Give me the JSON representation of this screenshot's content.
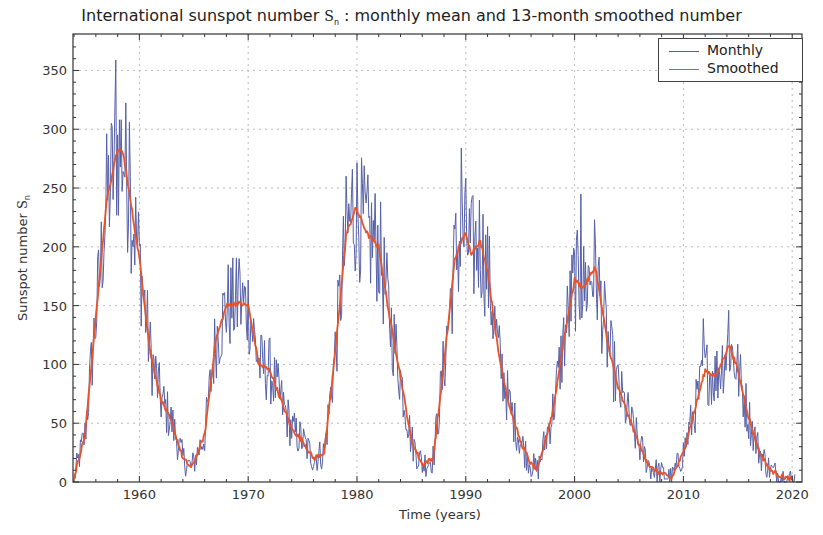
{
  "chart_data": {
    "type": "line",
    "title": "International sunspot number Sn : monthly mean and 13-month smoothed number",
    "title_parts": {
      "pre": "International sunspot number ",
      "symbol": "S",
      "symbol_sub": "n",
      "post": " : monthly mean and 13-month smoothed number"
    },
    "xlabel": "Time (years)",
    "ylabel": "Sunspot number Sn",
    "ylabel_parts": {
      "pre": "Sunspot number ",
      "symbol": "S",
      "symbol_sub": "n"
    },
    "xlim": [
      1953.9,
      2020.9
    ],
    "ylim": [
      0,
      381
    ],
    "x_ticks": [
      1960,
      1970,
      1980,
      1990,
      2000,
      2010,
      2020
    ],
    "y_ticks": [
      0,
      50,
      100,
      150,
      200,
      250,
      300,
      350
    ],
    "grid": true,
    "legend_position": "upper right",
    "legend": [
      "Monthly",
      "Smoothed"
    ],
    "colors": {
      "monthly": "#5560a8",
      "smoothed": "#e8532a"
    },
    "series": [
      {
        "name": "Smoothed",
        "x": [
          1954,
          1955,
          1956,
          1957,
          1958,
          1958.5,
          1959,
          1960,
          1961,
          1962,
          1963,
          1964,
          1964.8,
          1966,
          1967,
          1968,
          1969,
          1970,
          1971,
          1972,
          1973,
          1974,
          1975,
          1976,
          1977,
          1978,
          1979,
          1979.9,
          1981,
          1982,
          1983,
          1984,
          1985,
          1986,
          1987,
          1988,
          1989,
          1989.9,
          1990.5,
          1991.3,
          1992,
          1993,
          1994,
          1995,
          1996,
          1996.6,
          1998,
          1999,
          2000,
          2000.8,
          2001.9,
          2003,
          2004,
          2005,
          2006,
          2007,
          2008.9,
          2010,
          2011,
          2012,
          2013,
          2014.2,
          2015,
          2016,
          2017,
          2018,
          2019,
          2020
        ],
        "values": [
          4,
          40,
          140,
          240,
          283,
          280,
          250,
          190,
          110,
          70,
          50,
          20,
          12,
          40,
          120,
          150,
          152,
          150,
          100,
          95,
          70,
          45,
          35,
          20,
          25,
          110,
          210,
          233,
          210,
          200,
          140,
          90,
          35,
          15,
          20,
          100,
          190,
          212,
          195,
          205,
          180,
          110,
          65,
          35,
          15,
          10,
          60,
          120,
          172,
          165,
          183,
          120,
          80,
          55,
          30,
          12,
          3,
          25,
          60,
          95,
          90,
          117,
          95,
          55,
          25,
          10,
          5,
          2
        ]
      },
      {
        "name": "Monthly",
        "note": "monthly mean series fluctuates around the smoothed curve; notable peaks",
        "peaks": [
          {
            "x": 1957.8,
            "y": 359
          },
          {
            "x": 1959.1,
            "y": 306
          },
          {
            "x": 1969.2,
            "y": 190
          },
          {
            "x": 1979.6,
            "y": 266
          },
          {
            "x": 1989.6,
            "y": 284
          },
          {
            "x": 2000.6,
            "y": 245
          },
          {
            "x": 2011.8,
            "y": 139
          },
          {
            "x": 2014.2,
            "y": 146
          }
        ]
      }
    ]
  }
}
